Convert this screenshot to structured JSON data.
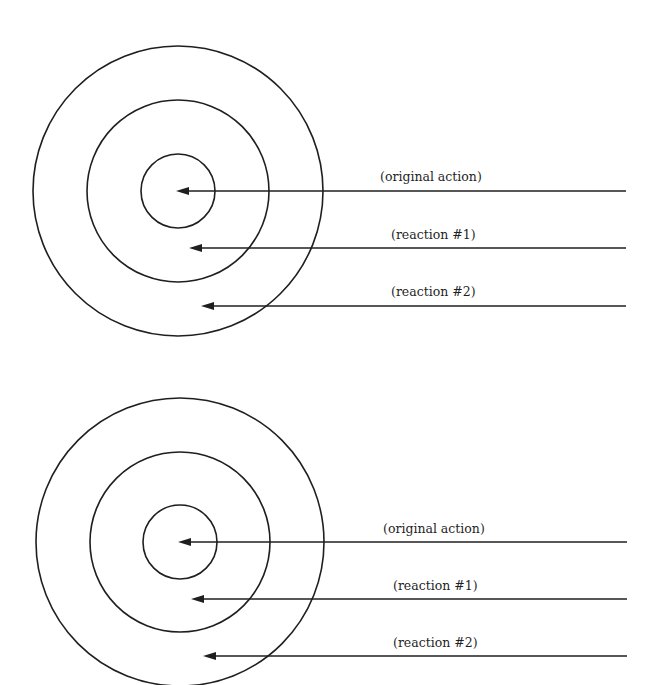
{
  "diagrams": [
    {
      "name": "top",
      "center": [
        178,
        191
      ],
      "rings": [
        {
          "name": "outer-ring",
          "r": 145
        },
        {
          "name": "middle-ring",
          "r": 91
        },
        {
          "name": "inner-ring",
          "r": 37
        }
      ],
      "arrows": [
        {
          "label": "(original action)",
          "y": 191,
          "tip_x": 176,
          "end_x": 626,
          "label_x": 380,
          "label_y": 171
        },
        {
          "label": "(reaction #1)",
          "y": 248,
          "tip_x": 189,
          "end_x": 626,
          "label_x": 391,
          "label_y": 229
        },
        {
          "label": "(reaction #2)",
          "y": 306,
          "tip_x": 201,
          "end_x": 626,
          "label_x": 391,
          "label_y": 286
        }
      ]
    },
    {
      "name": "bottom",
      "center": [
        180,
        542
      ],
      "rings": [
        {
          "name": "outer-ring",
          "r": 144
        },
        {
          "name": "middle-ring",
          "r": 90
        },
        {
          "name": "inner-ring",
          "r": 37
        }
      ],
      "arrows": [
        {
          "label": "(original action)",
          "y": 542,
          "tip_x": 178,
          "end_x": 627,
          "label_x": 383,
          "label_y": 523
        },
        {
          "label": "(reaction #1)",
          "y": 599,
          "tip_x": 191,
          "end_x": 627,
          "label_x": 393,
          "label_y": 580
        },
        {
          "label": "(reaction #2)",
          "y": 656,
          "tip_x": 203,
          "end_x": 627,
          "label_x": 393,
          "label_y": 637
        }
      ]
    }
  ],
  "labels": {
    "top_original": "(original action)",
    "top_reaction1": "(reaction #1)",
    "top_reaction2": "(reaction #2)",
    "bottom_original": "(original action)",
    "bottom_reaction1": "(reaction #1)",
    "bottom_reaction2": "(reaction #2)"
  },
  "colors": {
    "stroke": "#1f1f1f",
    "background": "#ffffff"
  }
}
